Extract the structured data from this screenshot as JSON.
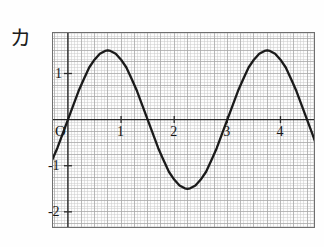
{
  "figure": {
    "label": "カ",
    "label_name": "katakana-ka"
  },
  "colors": {
    "background": "#fefefe",
    "curve": "#1a1a1a",
    "axis": "#2a2a2a",
    "frame": "#6f6f6f",
    "grid_minor": "#c9c9c9",
    "grid_major": "#a8a8a8",
    "text": "#161616"
  },
  "axes": {
    "origin_label": "O",
    "x_ticks": [
      {
        "value": 1,
        "label": "1"
      },
      {
        "value": 2,
        "label": "2"
      },
      {
        "value": 3,
        "label": "3"
      },
      {
        "value": 4,
        "label": "4"
      }
    ],
    "y_ticks": [
      {
        "value": 1,
        "label": "1"
      },
      {
        "value": -1,
        "label": "-1"
      },
      {
        "value": -2,
        "label": "-2"
      }
    ],
    "xlim": [
      -0.3,
      4.65
    ],
    "ylim": [
      -2.35,
      1.9
    ],
    "grid": true,
    "grid_minor_step": 0.0625,
    "grid_major_step": 0.25
  },
  "chart_data": {
    "type": "line",
    "title": "",
    "xlabel": "",
    "ylabel": "",
    "grid": true,
    "legend": "none",
    "xlim": [
      -0.3,
      4.65
    ],
    "ylim": [
      -2.35,
      1.9
    ],
    "series": [
      {
        "name": "sinusoid",
        "form": "y = 1.5 * sin(2*pi*x/3)",
        "amplitude": 1.5,
        "period": 3.0,
        "phase": 0.0,
        "offset": 0.0,
        "x": [
          -0.3,
          -0.2,
          -0.1,
          0.0,
          0.1,
          0.2,
          0.3,
          0.4,
          0.5,
          0.6,
          0.7,
          0.75,
          0.8,
          0.9,
          1.0,
          1.1,
          1.2,
          1.3,
          1.4,
          1.5,
          1.6,
          1.7,
          1.8,
          1.9,
          2.0,
          2.1,
          2.2,
          2.25,
          2.3,
          2.4,
          2.5,
          2.6,
          2.7,
          2.8,
          2.9,
          3.0,
          3.1,
          3.2,
          3.3,
          3.4,
          3.5,
          3.6,
          3.7,
          3.75,
          3.8,
          3.9,
          4.0,
          4.1,
          4.2,
          4.3,
          4.4,
          4.5,
          4.6,
          4.65
        ],
        "y": [
          -0.88,
          -0.62,
          -0.31,
          0.0,
          0.31,
          0.62,
          0.88,
          1.13,
          1.3,
          1.43,
          1.49,
          1.5,
          1.49,
          1.43,
          1.3,
          1.13,
          0.88,
          0.62,
          0.31,
          0.0,
          -0.31,
          -0.62,
          -0.88,
          -1.13,
          -1.3,
          -1.43,
          -1.49,
          -1.5,
          -1.49,
          -1.43,
          -1.3,
          -1.13,
          -0.88,
          -0.62,
          -0.31,
          0.0,
          0.31,
          0.62,
          0.88,
          1.13,
          1.3,
          1.43,
          1.49,
          1.5,
          1.49,
          1.43,
          1.3,
          1.13,
          0.88,
          0.62,
          0.31,
          0.0,
          -0.31,
          -0.47
        ],
        "key_points": [
          {
            "x": 0.0,
            "y": 0.0,
            "kind": "zero-crossing-rising"
          },
          {
            "x": 0.75,
            "y": 1.5,
            "kind": "maximum"
          },
          {
            "x": 1.5,
            "y": 0.0,
            "kind": "zero-crossing-falling"
          },
          {
            "x": 2.25,
            "y": -1.5,
            "kind": "minimum"
          },
          {
            "x": 3.0,
            "y": 0.0,
            "kind": "zero-crossing-rising"
          },
          {
            "x": 3.75,
            "y": 1.5,
            "kind": "maximum"
          },
          {
            "x": 4.5,
            "y": 0.0,
            "kind": "zero-crossing-falling"
          }
        ]
      }
    ]
  }
}
